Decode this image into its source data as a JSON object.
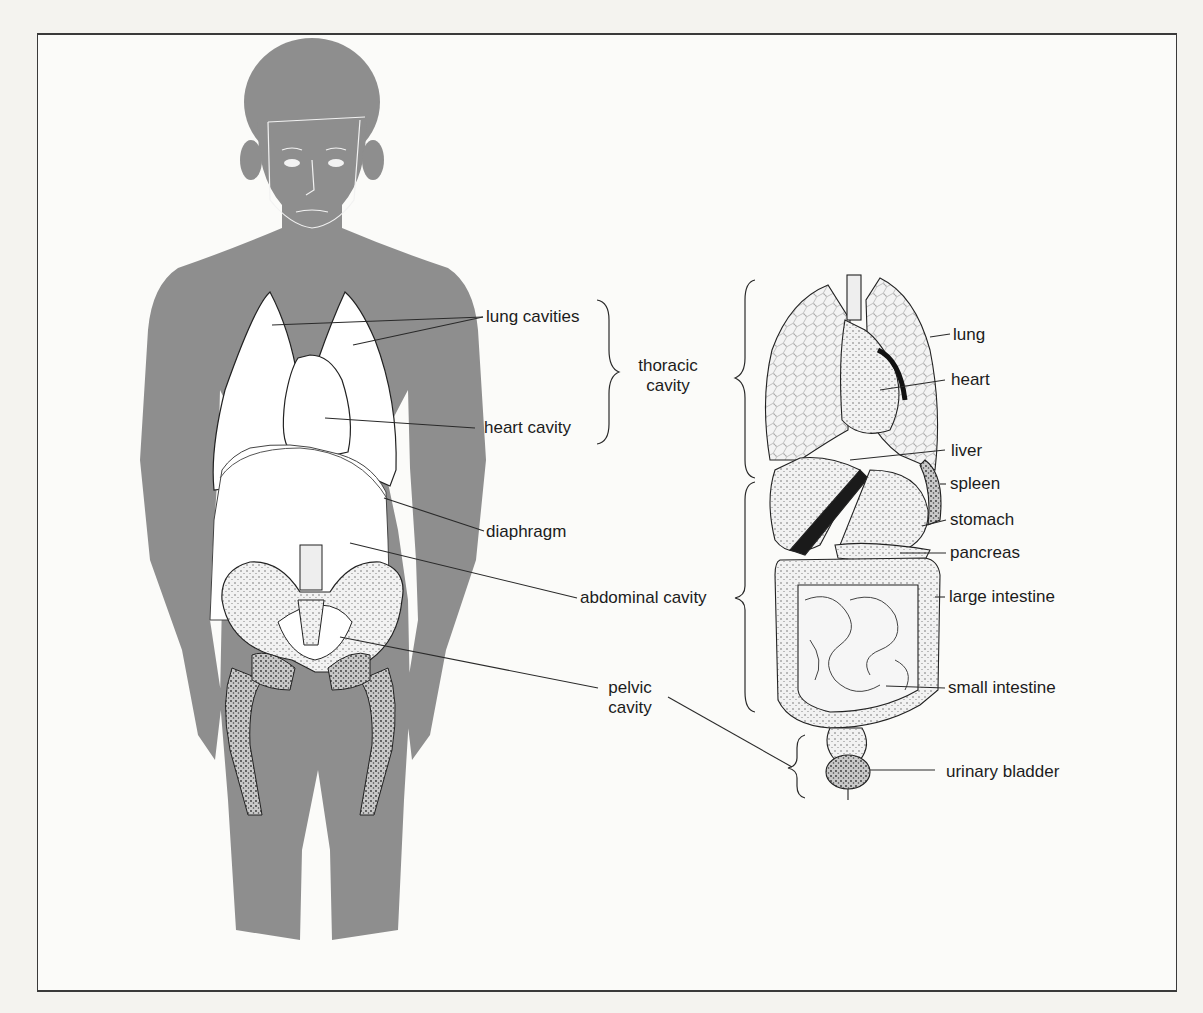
{
  "figure": {
    "colors": {
      "body_silhouette": "#8e8e8e",
      "cavity_fill": "#ffffff",
      "line": "#2a2a2a",
      "background": "#fbfbf9"
    },
    "left_panel": {
      "description": "human body silhouette showing body cavities",
      "labels": {
        "lung_cavities": "lung cavities",
        "heart_cavity": "heart cavity",
        "diaphragm": "diaphragm",
        "abdominal_cavity": "abdominal cavity",
        "pelvic_cavity_line1": "pelvic",
        "pelvic_cavity_line2": "cavity"
      },
      "group_labels": {
        "thoracic_cavity_line1": "thoracic",
        "thoracic_cavity_line2": "cavity"
      }
    },
    "right_panel": {
      "description": "internal organs illustration",
      "labels": {
        "lung": "lung",
        "heart": "heart",
        "liver": "liver",
        "spleen": "spleen",
        "stomach": "stomach",
        "pancreas": "pancreas",
        "large_intestine": "large intestine",
        "small_intestine": "small intestine",
        "urinary_bladder": "urinary bladder"
      }
    }
  }
}
